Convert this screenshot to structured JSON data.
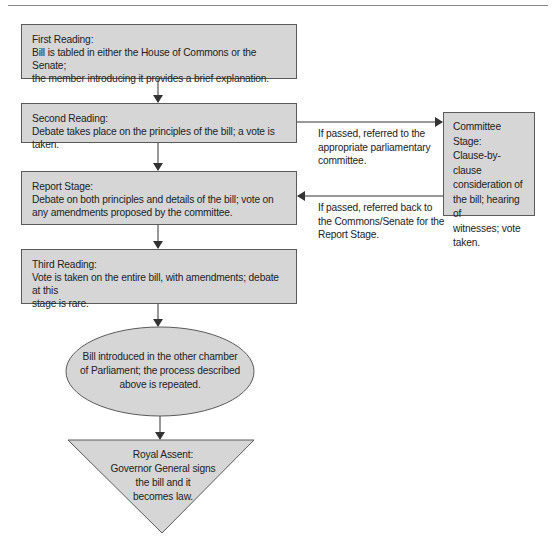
{
  "diagram": {
    "type": "flowchart",
    "colors": {
      "node_fill": "#d6d6d6",
      "node_border": "#5a5a5a",
      "arrow": "#333333",
      "text": "#222222"
    },
    "nodes": {
      "first_reading": {
        "shape": "rectangle",
        "title": "First Reading:",
        "lines": [
          "Bill is tabled in either the House of Commons or the Senate;",
          "the member introducing it provides a brief explanation."
        ]
      },
      "second_reading": {
        "shape": "rectangle",
        "title": "Second Reading:",
        "lines": [
          "Debate takes place on the principles of the bill; a vote is taken."
        ]
      },
      "report_stage": {
        "shape": "rectangle",
        "title": "Report Stage:",
        "lines": [
          "Debate on both principles and details of the bill; vote on",
          "any amendments proposed by the committee."
        ]
      },
      "third_reading": {
        "shape": "rectangle",
        "title": "Third Reading:",
        "lines": [
          "Vote is taken on the entire bill, with amendments; debate at this",
          "stage is rare."
        ]
      },
      "committee_stage": {
        "shape": "rectangle",
        "lines": [
          "Committee Stage:",
          "Clause-by-clause",
          "consideration of",
          "the bill; hearing of",
          "witnesses; vote",
          "taken."
        ]
      },
      "other_chamber": {
        "shape": "ellipse",
        "lines": [
          "Bill introduced in the other chamber",
          "of Parliament; the process described",
          "above is repeated."
        ]
      },
      "royal_assent": {
        "shape": "inverted-triangle",
        "lines": [
          "Royal Assent:",
          "Governor General signs",
          "the bill and it",
          "becomes law."
        ]
      }
    },
    "edges": {
      "to_committee": {
        "from": "second_reading",
        "to": "committee_stage",
        "lines": [
          "If passed, referred to the",
          "appropriate parliamentary",
          "committee."
        ]
      },
      "back_to_report": {
        "from": "committee_stage",
        "to": "report_stage",
        "lines": [
          "If passed, referred back to",
          "the Commons/Senate for the",
          "Report Stage."
        ]
      },
      "sequence": [
        [
          "first_reading",
          "second_reading"
        ],
        [
          "second_reading",
          "report_stage"
        ],
        [
          "report_stage",
          "third_reading"
        ],
        [
          "third_reading",
          "other_chamber"
        ],
        [
          "other_chamber",
          "royal_assent"
        ]
      ]
    }
  }
}
